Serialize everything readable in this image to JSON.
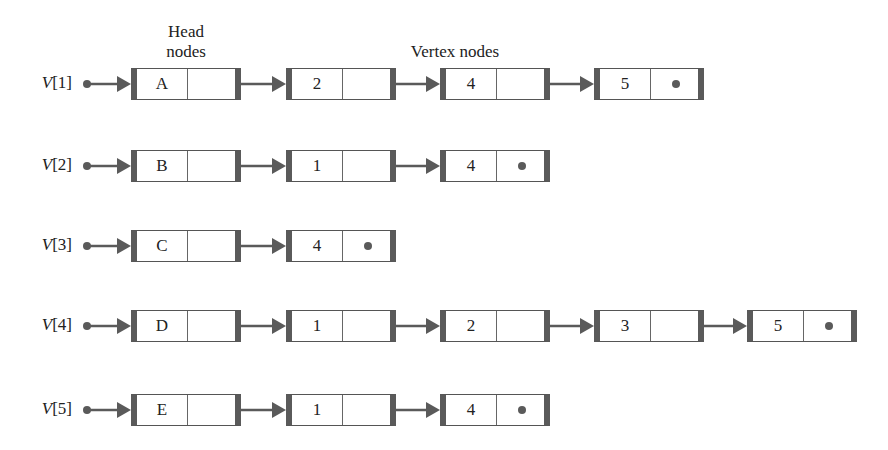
{
  "captions": {
    "head_nodes": [
      "Head",
      "nodes"
    ],
    "vertex_nodes": "Vertex nodes"
  },
  "colors": {
    "line": "#5a5a5a",
    "border": "#555555",
    "background": "#ffffff",
    "text": "#222222"
  },
  "rows": [
    {
      "label_var": "V",
      "label_index": "[1]",
      "head": "A",
      "vertices": [
        "2",
        "4",
        "5"
      ]
    },
    {
      "label_var": "V",
      "label_index": "[2]",
      "head": "B",
      "vertices": [
        "1",
        "4"
      ]
    },
    {
      "label_var": "V",
      "label_index": "[3]",
      "head": "C",
      "vertices": [
        "4"
      ]
    },
    {
      "label_var": "V",
      "label_index": "[4]",
      "head": "D",
      "vertices": [
        "1",
        "2",
        "3",
        "5"
      ]
    },
    {
      "label_var": "V",
      "label_index": "[5]",
      "head": "E",
      "vertices": [
        "1",
        "4"
      ]
    }
  ]
}
